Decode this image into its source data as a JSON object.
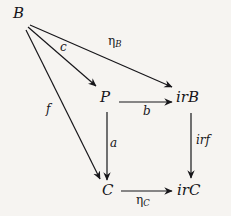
{
  "diagram": {
    "background_color": "#f6f4f1",
    "ink_color": "#17161a",
    "nodes": [
      {
        "id": "B",
        "label": "B"
      },
      {
        "id": "P",
        "label": "P"
      },
      {
        "id": "irB",
        "label": "irB"
      },
      {
        "id": "C",
        "label": "C"
      },
      {
        "id": "irC",
        "label": "irC"
      }
    ],
    "edges": [
      {
        "id": "c",
        "from": "B",
        "to": "P",
        "label": "c",
        "subscript": ""
      },
      {
        "id": "etaB",
        "from": "B",
        "to": "irB",
        "label": "η",
        "subscript": "B"
      },
      {
        "id": "f",
        "from": "B",
        "to": "C",
        "label": "f",
        "subscript": ""
      },
      {
        "id": "b",
        "from": "P",
        "to": "irB",
        "label": "b",
        "subscript": ""
      },
      {
        "id": "a",
        "from": "P",
        "to": "C",
        "label": "a",
        "subscript": ""
      },
      {
        "id": "irf",
        "from": "irB",
        "to": "irC",
        "label": "irf",
        "subscript": ""
      },
      {
        "id": "etaC",
        "from": "C",
        "to": "irC",
        "label": "η",
        "subscript": "C"
      }
    ]
  }
}
